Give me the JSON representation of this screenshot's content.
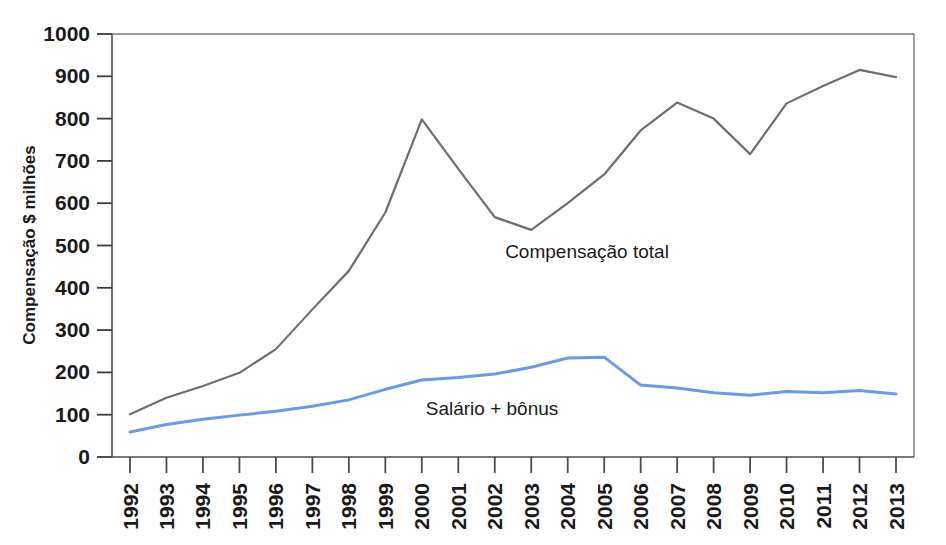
{
  "chart_data": {
    "type": "line",
    "title": "",
    "xlabel": "",
    "ylabel": "Compensação $ milhões",
    "ylim": [
      0,
      1000
    ],
    "yticks": [
      0,
      100,
      200,
      300,
      400,
      500,
      600,
      700,
      800,
      900,
      1000
    ],
    "grid": false,
    "legend_position": "inline-annotations",
    "categories": [
      "1992",
      "1993",
      "1994",
      "1995",
      "1996",
      "1997",
      "1998",
      "1999",
      "2000",
      "2001",
      "2002",
      "2003",
      "2004",
      "2005",
      "2006",
      "2007",
      "2008",
      "2009",
      "2010",
      "2011",
      "2012",
      "2013"
    ],
    "series": [
      {
        "name": "Compensação total",
        "color": "#6e6e6e",
        "values": [
          101,
          140,
          168,
          199,
          255,
          349,
          440,
          578,
          798,
          681,
          567,
          537,
          600,
          668,
          772,
          838,
          800,
          716,
          836,
          877,
          915,
          898
        ]
      },
      {
        "name": "Salário + bônus",
        "color": "#6b9be4",
        "values": [
          59,
          77,
          89,
          99,
          108,
          120,
          135,
          160,
          182,
          188,
          196,
          212,
          234,
          236,
          170,
          163,
          152,
          146,
          155,
          152,
          157,
          149
        ]
      }
    ],
    "annotations": [
      {
        "text": "Compensação total",
        "x": 2002,
        "y": 490
      },
      {
        "text": "Salário + bônus",
        "x": 2000,
        "y": 112
      }
    ]
  },
  "axis": {
    "y_title": "Compensação $ milhões",
    "y_tick_labels": [
      "1000",
      "900",
      "800",
      "700",
      "600",
      "500",
      "400",
      "300",
      "200",
      "100",
      "0"
    ],
    "x_tick_labels": [
      "1992",
      "1993",
      "1994",
      "1995",
      "1996",
      "1997",
      "1998",
      "1999",
      "2000",
      "2001",
      "2002",
      "2003",
      "2004",
      "2005",
      "2006",
      "2007",
      "2008",
      "2009",
      "2010",
      "2011",
      "2012",
      "2013"
    ]
  },
  "series_labels": {
    "total": "Compensação total",
    "salary": "Salário + bônus"
  },
  "colors": {
    "total_line": "#6e6e6e",
    "salary_line": "#6b9be4",
    "axis": "#4d4d4d",
    "text": "#1a1a1a",
    "background": "#ffffff"
  }
}
